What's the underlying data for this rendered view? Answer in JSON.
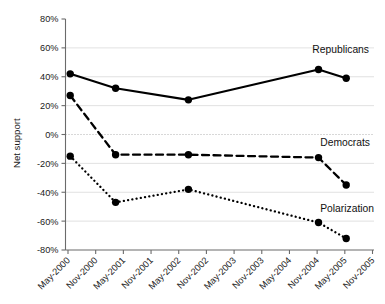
{
  "chart_data": {
    "type": "line",
    "title": "",
    "xlabel": "",
    "ylabel": "Net support",
    "ylim": [
      -80,
      80
    ],
    "ytick_values": [
      80,
      60,
      40,
      20,
      0,
      -20,
      -40,
      -60,
      -80
    ],
    "ytick_labels": [
      "80%",
      "60%",
      "40%",
      "20%",
      "0%",
      "-20%",
      "-40%",
      "-60%",
      "-80%"
    ],
    "grid": true,
    "legend_position": "inline-right",
    "x_axis_ticks": [
      "May-2000",
      "Nov-2000",
      "May-2001",
      "Nov-2001",
      "May-2002",
      "Nov-2002",
      "May-2003",
      "Nov-2003",
      "May-2004",
      "Nov-2004",
      "May-2005",
      "Nov-2005"
    ],
    "x": [
      "May-2000",
      "Mar-2001",
      "Jul-2002",
      "Dec-2004",
      "Jul-2005"
    ],
    "series": [
      {
        "name": "Republicans",
        "style": "solid",
        "values": [
          42,
          32,
          24,
          45,
          39
        ]
      },
      {
        "name": "Democrats",
        "style": "dashed",
        "values": [
          27,
          -14,
          -14,
          -16,
          -35
        ]
      },
      {
        "name": "Polarization",
        "style": "dotted",
        "values": [
          -15,
          -47,
          -38,
          -61,
          -72
        ]
      }
    ],
    "annotations": [
      {
        "text": "Republicans",
        "series": "Republicans"
      },
      {
        "text": "Democrats",
        "series": "Democrats"
      },
      {
        "text": "Polarization",
        "series": "Polarization"
      }
    ]
  },
  "colors": {
    "ink": "#000000",
    "axis": "#6b6b6b",
    "grid": "#d9d9d9",
    "background": "#ffffff"
  }
}
